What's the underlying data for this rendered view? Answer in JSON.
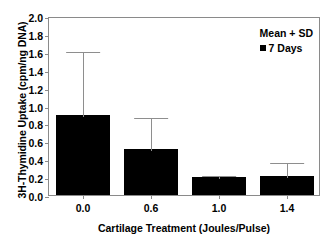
{
  "chart_data": {
    "type": "bar",
    "title": "",
    "xlabel": "Cartilage Treatment (Joules/Pulse)",
    "ylabel": "3H-Thymidine Uptake (cpm/ng DNA)",
    "categories": [
      "0.0",
      "0.6",
      "1.0",
      "1.4"
    ],
    "values": [
      0.89,
      0.51,
      0.2,
      0.21
    ],
    "errors_upper": [
      0.73,
      0.37,
      0.03,
      0.17
    ],
    "error_tops": [
      1.62,
      0.88,
      0.23,
      0.38
    ],
    "error_type": "SD (upper only)",
    "ylim": [
      0.0,
      2.0
    ],
    "ytick_values": [
      0.0,
      0.2,
      0.4,
      0.6,
      0.8,
      1.0,
      1.2,
      1.4,
      1.6,
      1.8,
      2.0
    ],
    "ytick_labels": [
      "0.0",
      "0.2",
      "0.4",
      "0.6",
      "0.8",
      "1.0",
      "1.2",
      "1.4",
      "1.6",
      "1.8",
      "2.0"
    ],
    "grid": false,
    "legend_position": "top-right",
    "legend": {
      "note": "Mean + SD",
      "series_label": "7 Days"
    },
    "series": [
      {
        "name": "7 Days",
        "values": [
          0.89,
          0.51,
          0.2,
          0.21
        ]
      }
    ],
    "colors": {
      "bar_fill": "#000000",
      "error_bar": "#8e8e8e",
      "axis": "#8a8a8a",
      "text": "#000000",
      "background": "#ffffff"
    }
  }
}
